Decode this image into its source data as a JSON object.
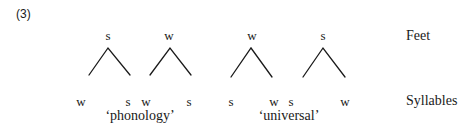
{
  "example_number": "(3)",
  "tiers": {
    "feet_label": "Feet",
    "syllables_label": "Syllables"
  },
  "feet": [
    {
      "label": "s",
      "apex": [
        108,
        48
      ],
      "left": [
        89,
        75
      ],
      "right": [
        130,
        75
      ],
      "label_x": 108
    },
    {
      "label": "w",
      "apex": [
        170,
        48
      ],
      "left": [
        150,
        75
      ],
      "right": [
        191,
        75
      ],
      "label_x": 169
    },
    {
      "label": "w",
      "apex": [
        251,
        48
      ],
      "left": [
        231,
        77
      ],
      "right": [
        272,
        77
      ],
      "label_x": 252
    },
    {
      "label": "s",
      "apex": [
        323,
        48
      ],
      "left": [
        303,
        77
      ],
      "right": [
        345,
        77
      ],
      "label_x": 323
    }
  ],
  "syllables": [
    {
      "label": "w",
      "x": 81
    },
    {
      "label": "s",
      "x": 128
    },
    {
      "label": "w",
      "x": 146
    },
    {
      "label": "s",
      "x": 189
    },
    {
      "label": "s",
      "x": 231
    },
    {
      "label": "w",
      "x": 274
    },
    {
      "label": "s",
      "x": 291
    },
    {
      "label": "w",
      "x": 345
    }
  ],
  "words": [
    {
      "text": "‘phonology’",
      "x": 140
    },
    {
      "text": "‘universal’",
      "x": 289
    }
  ],
  "colors": {
    "ink": "#1a1a1a",
    "background": "#ffffff"
  }
}
